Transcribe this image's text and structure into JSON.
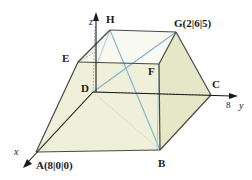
{
  "figure": {
    "type": "geometry-diagram",
    "colors": {
      "face_front": "#eef0da",
      "face_right": "#e5e8c6",
      "face_top": "#f7f8ee",
      "edge": "#4a4a42",
      "edge_light": "#9a9a86",
      "axis": "#1a1a1a",
      "diagonal": "#7fb2d0",
      "dotted": "#8a8a78",
      "background": "#ffffff"
    },
    "axes": [
      {
        "name": "x",
        "label": "x"
      },
      {
        "name": "y",
        "label": "y"
      },
      {
        "name": "z",
        "label": "z"
      }
    ],
    "tick_labels": [
      {
        "name": "y-tick-8",
        "label": "8"
      }
    ],
    "vertices": [
      {
        "name": "A",
        "label": "A(8|0|0)"
      },
      {
        "name": "B",
        "label": "B"
      },
      {
        "name": "C",
        "label": "C"
      },
      {
        "name": "D",
        "label": "D"
      },
      {
        "name": "E",
        "label": "E"
      },
      {
        "name": "F",
        "label": "F"
      },
      {
        "name": "G",
        "label": "G(2|6|5)"
      },
      {
        "name": "H",
        "label": "H"
      }
    ]
  }
}
